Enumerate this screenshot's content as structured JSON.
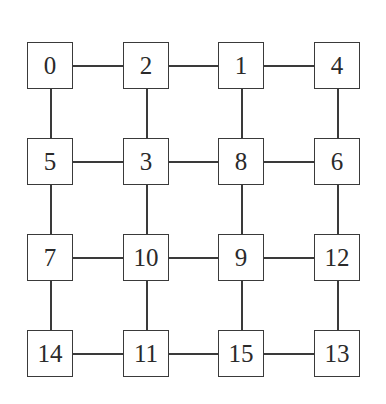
{
  "diagram": {
    "type": "4x4 mesh grid",
    "grid": [
      [
        "0",
        "2",
        "1",
        "4"
      ],
      [
        "5",
        "3",
        "8",
        "6"
      ],
      [
        "7",
        "10",
        "9",
        "12"
      ],
      [
        "14",
        "11",
        "15",
        "13"
      ]
    ],
    "nodes": [
      {
        "label": "0",
        "row": 0,
        "col": 0
      },
      {
        "label": "2",
        "row": 0,
        "col": 1
      },
      {
        "label": "1",
        "row": 0,
        "col": 2
      },
      {
        "label": "4",
        "row": 0,
        "col": 3
      },
      {
        "label": "5",
        "row": 1,
        "col": 0
      },
      {
        "label": "3",
        "row": 1,
        "col": 1
      },
      {
        "label": "8",
        "row": 1,
        "col": 2
      },
      {
        "label": "6",
        "row": 1,
        "col": 3
      },
      {
        "label": "7",
        "row": 2,
        "col": 0
      },
      {
        "label": "10",
        "row": 2,
        "col": 1
      },
      {
        "label": "9",
        "row": 2,
        "col": 2
      },
      {
        "label": "12",
        "row": 2,
        "col": 3
      },
      {
        "label": "14",
        "row": 3,
        "col": 0
      },
      {
        "label": "11",
        "row": 3,
        "col": 1
      },
      {
        "label": "15",
        "row": 3,
        "col": 2
      },
      {
        "label": "13",
        "row": 3,
        "col": 3
      }
    ],
    "edges": [
      [
        "0",
        "2"
      ],
      [
        "2",
        "1"
      ],
      [
        "1",
        "4"
      ],
      [
        "5",
        "3"
      ],
      [
        "3",
        "8"
      ],
      [
        "8",
        "6"
      ],
      [
        "7",
        "10"
      ],
      [
        "10",
        "9"
      ],
      [
        "9",
        "12"
      ],
      [
        "14",
        "11"
      ],
      [
        "11",
        "15"
      ],
      [
        "15",
        "13"
      ],
      [
        "0",
        "5"
      ],
      [
        "5",
        "7"
      ],
      [
        "7",
        "14"
      ],
      [
        "2",
        "3"
      ],
      [
        "3",
        "10"
      ],
      [
        "10",
        "11"
      ],
      [
        "1",
        "8"
      ],
      [
        "8",
        "9"
      ],
      [
        "9",
        "15"
      ],
      [
        "4",
        "6"
      ],
      [
        "6",
        "12"
      ],
      [
        "12",
        "13"
      ]
    ],
    "colors": {
      "stroke": "#3a3a3a",
      "fill": "#ffffff",
      "text": "#2a2a2a"
    }
  }
}
